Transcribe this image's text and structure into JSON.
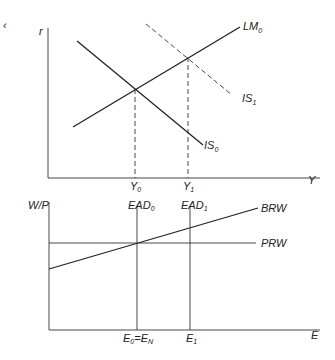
{
  "top_panel": {
    "corner_mark": "‹",
    "y_axis_label": "r",
    "x_axis_label": "Y",
    "curves": {
      "lm0": {
        "name": "LM",
        "sub": "0"
      },
      "is0": {
        "name": "IS",
        "sub": "0"
      },
      "is1": {
        "name": "IS",
        "sub": "1",
        "style": "dashed"
      }
    },
    "x_ticks": [
      {
        "name": "Y",
        "sub": "0"
      },
      {
        "name": "Y",
        "sub": "1"
      }
    ]
  },
  "bottom_panel": {
    "y_axis_label": "W/P",
    "x_axis_label": "E",
    "curves": {
      "brw": {
        "name": "BRW"
      },
      "prw": {
        "name": "PRW"
      },
      "ead0": {
        "name": "EAD",
        "sub": "0"
      },
      "ead1": {
        "name": "EAD",
        "sub": "1"
      }
    },
    "x_ticks": [
      {
        "name": "E",
        "sub": "0",
        "eq": "=",
        "name2": "E",
        "sub2": "N"
      },
      {
        "name": "E",
        "sub": "1"
      }
    ]
  }
}
